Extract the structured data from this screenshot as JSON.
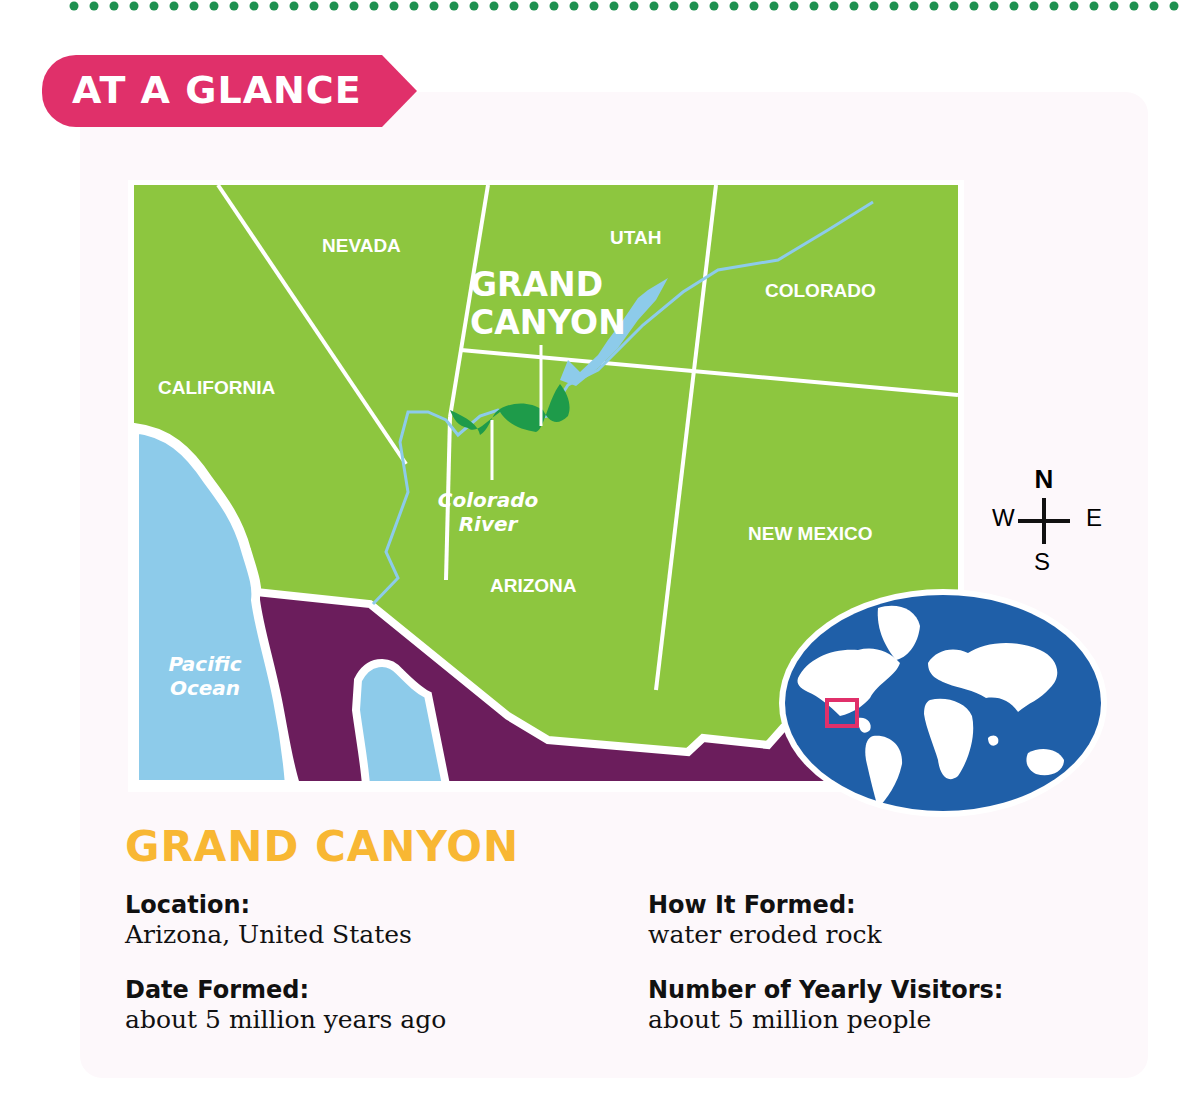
{
  "colors": {
    "dots": "#1e9150",
    "banner": "#e0306a",
    "land": "#8dc63f",
    "mexico": "#6b1d5c",
    "water": "#8dcbea",
    "canyon": "#1e9b4a",
    "globe": "#1f5fa8",
    "title": "#f8b733"
  },
  "banner": {
    "label": "AT A GLANCE"
  },
  "map": {
    "states": [
      "NEVADA",
      "UTAH",
      "COLORADO",
      "CALIFORNIA",
      "ARIZONA",
      "NEW MEXICO"
    ],
    "feature_label": {
      "line1": "GRAND",
      "line2": "CANYON"
    },
    "river_label": {
      "line1": "Colorado",
      "line2": "River"
    },
    "ocean_label": {
      "line1": "Pacific",
      "line2": "Ocean"
    },
    "compass": {
      "n": "N",
      "w": "W",
      "e": "E",
      "s": "S"
    }
  },
  "info": {
    "title": "GRAND CANYON",
    "facts": [
      {
        "label": "Location:",
        "value": "Arizona, United States"
      },
      {
        "label": "Date Formed:",
        "value": "about 5 million years ago"
      },
      {
        "label": "How It Formed:",
        "value": "water eroded rock"
      },
      {
        "label": "Number of Yearly Visitors:",
        "value": "about 5 million people"
      }
    ]
  }
}
